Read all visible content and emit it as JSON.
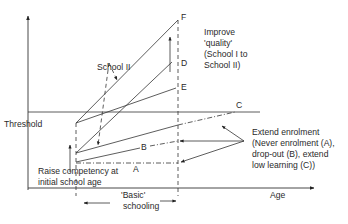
{
  "diagram": {
    "axes": {
      "x_label": "Age",
      "y_label": ""
    },
    "threshold_label": "Threshold",
    "school_ii_label": "School II",
    "quality": {
      "line1": "Improve",
      "line2": "'quality'",
      "line3": "(School I to",
      "line4": "School II)"
    },
    "point_labels": {
      "F": "F",
      "D": "D",
      "E": "E",
      "C": "C",
      "B": "B",
      "A": "A"
    },
    "raise": {
      "line1": "Raise competency at",
      "line2": "initial school age"
    },
    "enrolment": {
      "line1": "Extend enrolment",
      "line2": "(Never enrolment (A),",
      "line3": "drop-out (B), extend",
      "line4": "low learning (C))"
    },
    "basic": {
      "line1": "'Basic'",
      "line2": "schooling"
    }
  }
}
